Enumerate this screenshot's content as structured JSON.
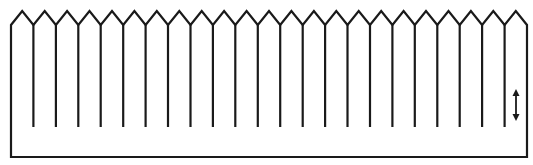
{
  "diagram": {
    "type": "comb-fin-structure",
    "stroke_color": "#1a1a1a",
    "background": "#ffffff",
    "geometry": {
      "left_edge_x": 11,
      "right_edge_x": 527,
      "bottom_y": 157,
      "peak_y": 11,
      "valley_y": 25,
      "shoulder_y": 25,
      "first_peak_x": 23,
      "peak_count": 23,
      "pitch": 22.4,
      "fin_bottom_y": 127,
      "fin_count": 22
    },
    "arrow": {
      "semantic": "double-vertical-arrow",
      "x": 516,
      "y_top": 89,
      "y_bottom": 121
    }
  }
}
